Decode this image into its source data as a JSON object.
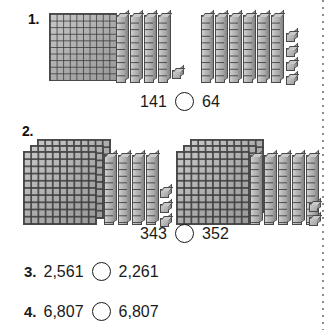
{
  "page": {
    "background_color": "#ffffff",
    "ink_color": "#1a1a1a",
    "block_fill_color": "#b0b0b0",
    "block_line_color": "#4a4a4a"
  },
  "margin_rule": {
    "name": "dotted-vertical-rule",
    "style": "dotted",
    "color": "#8c8c8c"
  },
  "problems": [
    {
      "number": "1.",
      "left_model": {
        "value": "141",
        "hundreds": 1,
        "tens": 4,
        "ones": 1
      },
      "right_model": {
        "value": "64",
        "hundreds": 0,
        "tens": 6,
        "ones": 4
      },
      "comparison": {
        "left": "141",
        "operator": "",
        "right": "64"
      }
    },
    {
      "number": "2.",
      "left_model": {
        "value": "343",
        "hundreds": 3,
        "tens": 4,
        "ones": 3
      },
      "right_model": {
        "value": "352",
        "hundreds": 3,
        "tens": 5,
        "ones": 2
      },
      "comparison": {
        "left": "343",
        "operator": "",
        "right": "352"
      }
    },
    {
      "number": "3.",
      "comparison": {
        "left": "2,561",
        "operator": "",
        "right": "2,261"
      }
    },
    {
      "number": "4.",
      "comparison": {
        "left": "6,807",
        "operator": "",
        "right": "6,807"
      }
    }
  ]
}
